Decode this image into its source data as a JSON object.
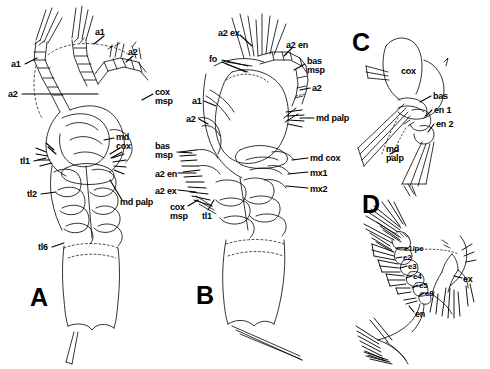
{
  "figure": {
    "background_color": "#ffffff",
    "ink_color": "#000000",
    "width": 490,
    "height": 369
  },
  "panels": [
    {
      "id": "A",
      "letter": "A",
      "caption": "Whole animal, dorsal view",
      "letter_pos": {
        "x": 30,
        "y": 285
      },
      "labels": [
        {
          "text": "a1",
          "x": 11,
          "y": 60,
          "size": "sm"
        },
        {
          "text": "a1",
          "x": 95,
          "y": 28,
          "size": "sm"
        },
        {
          "text": "a2",
          "x": 8,
          "y": 90,
          "size": "sm"
        },
        {
          "text": "a2",
          "x": 128,
          "y": 48,
          "size": "sm"
        },
        {
          "text": "cox\nmsp",
          "x": 155,
          "y": 88,
          "size": "sm"
        },
        {
          "text": "md\ncox",
          "x": 116,
          "y": 133,
          "size": "sm"
        },
        {
          "text": "tl1",
          "x": 20,
          "y": 157,
          "size": "sm"
        },
        {
          "text": "tl2",
          "x": 27,
          "y": 190,
          "size": "sm"
        },
        {
          "text": "md palp",
          "x": 120,
          "y": 198,
          "size": "sm"
        },
        {
          "text": "tl6",
          "x": 38,
          "y": 243,
          "size": "sm"
        }
      ]
    },
    {
      "id": "B",
      "letter": "B",
      "caption": "Whole animal, lateral view",
      "letter_pos": {
        "x": 196,
        "y": 283
      },
      "labels": [
        {
          "text": "a2 ex",
          "x": 218,
          "y": 29,
          "size": "sm"
        },
        {
          "text": "a2 en",
          "x": 286,
          "y": 41,
          "size": "sm"
        },
        {
          "text": "fo",
          "x": 209,
          "y": 55,
          "size": "sm"
        },
        {
          "text": "bas\nmsp",
          "x": 307,
          "y": 57,
          "size": "sm"
        },
        {
          "text": "a2",
          "x": 312,
          "y": 84,
          "size": "sm"
        },
        {
          "text": "a1",
          "x": 192,
          "y": 97,
          "size": "sm"
        },
        {
          "text": "a2",
          "x": 186,
          "y": 115,
          "size": "sm"
        },
        {
          "text": "md palp",
          "x": 316,
          "y": 114,
          "size": "sm"
        },
        {
          "text": "bas\nmsp",
          "x": 155,
          "y": 142,
          "size": "sm"
        },
        {
          "text": "a2 en",
          "x": 155,
          "y": 170,
          "size": "sm"
        },
        {
          "text": "md cox",
          "x": 310,
          "y": 154,
          "size": "sm"
        },
        {
          "text": "mx1",
          "x": 310,
          "y": 169,
          "size": "sm"
        },
        {
          "text": "a2 ex",
          "x": 155,
          "y": 187,
          "size": "sm"
        },
        {
          "text": "mx2",
          "x": 310,
          "y": 185,
          "size": "sm"
        },
        {
          "text": "cox\nmsp",
          "x": 170,
          "y": 203,
          "size": "sm"
        },
        {
          "text": "tl1",
          "x": 202,
          "y": 212,
          "size": "sm"
        }
      ]
    },
    {
      "id": "C",
      "letter": "C",
      "caption": "Mandible",
      "letter_pos": {
        "x": 352,
        "y": 30
      },
      "labels": [
        {
          "text": "cox",
          "x": 401,
          "y": 67,
          "size": "sm"
        },
        {
          "text": "bas",
          "x": 433,
          "y": 92,
          "size": "sm"
        },
        {
          "text": "en 1",
          "x": 434,
          "y": 106,
          "size": "sm"
        },
        {
          "text": "en 2",
          "x": 436,
          "y": 120,
          "size": "sm"
        },
        {
          "text": "md\npalp",
          "x": 386,
          "y": 145,
          "size": "sm"
        }
      ]
    },
    {
      "id": "D",
      "letter": "D",
      "caption": "Swimming leg",
      "letter_pos": {
        "x": 362,
        "y": 192
      },
      "labels": [
        {
          "text": "e1/pe",
          "x": 404,
          "y": 245,
          "size": "xs"
        },
        {
          "text": "e2",
          "x": 403,
          "y": 254,
          "size": "xs"
        },
        {
          "text": "e3",
          "x": 408,
          "y": 263,
          "size": "xs"
        },
        {
          "text": "e4",
          "x": 413,
          "y": 273,
          "size": "xs"
        },
        {
          "text": "e5",
          "x": 419,
          "y": 282,
          "size": "xs"
        },
        {
          "text": "e6",
          "x": 425,
          "y": 290,
          "size": "xs"
        },
        {
          "text": "en",
          "x": 415,
          "y": 310,
          "size": "sm"
        },
        {
          "text": "ex",
          "x": 463,
          "y": 275,
          "size": "sm"
        }
      ]
    }
  ],
  "abbreviations": {
    "a1": "antennule",
    "a2": "antenna",
    "a2 en": "antenna endopod",
    "a2 ex": "antenna exopod",
    "bas": "basis",
    "bas msp": "basis mouthpart seta",
    "cox": "coxa",
    "cox msp": "coxa mouthpart seta",
    "en": "endopod",
    "en 1": "endopod segment 1",
    "en 2": "endopod segment 2",
    "ex": "exopod",
    "e1/pe": "element 1 / proximal element",
    "fo": "frontal organ",
    "md cox": "mandible coxa",
    "md palp": "mandible palp",
    "mx1": "maxillule",
    "mx2": "maxilla",
    "tl1": "trunk limb 1",
    "tl2": "trunk limb 2",
    "tl6": "trunk limb 6"
  }
}
